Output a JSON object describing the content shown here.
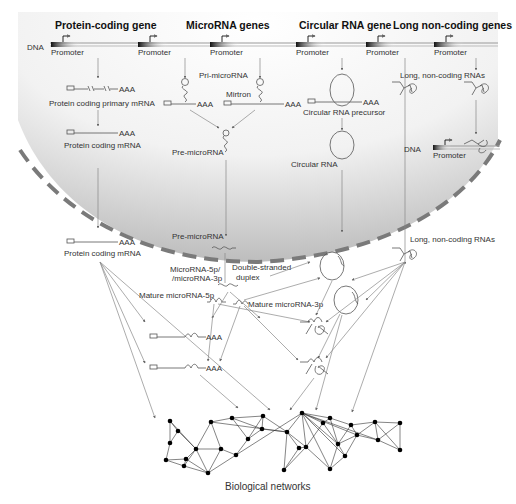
{
  "headers": {
    "protein_coding": "Protein-coding gene",
    "microrna": "MicroRNA genes",
    "circular": "Circular RNA gene",
    "lncrna": "Long non-coding genes"
  },
  "dna_label": "DNA",
  "promoter_label": "Promoter",
  "nucleus": {
    "protein_primary": "Protein coding primary mRNA",
    "protein_mrna": "Protein coding mRNA",
    "pri_microrna": "Pri-microRNA",
    "mirtron": "Mirtron",
    "pre_microrna": "Pre-microRNA",
    "circ_precursor": "Circular RNA precursor",
    "circ_rna": "Circular RNA",
    "lnc_rnas": "Long, non-coding RNAs",
    "dna_label2": "DNA",
    "promoter_label2": "Promoter",
    "polyA": "AAA"
  },
  "cytoplasm": {
    "protein_mrna": "Protein coding mRNA",
    "pre_microrna": "Pre-microRNA",
    "duplex_line1": "MicroRNA-5p/",
    "duplex_line2": "/microRNA-3p",
    "ds_line1": "Double-stranded",
    "ds_line2": "duplex",
    "mature_5p": "Mature microRNA-5p",
    "mature_3p": "Mature microRNA-3p",
    "lnc_rnas": "Long, non-coding RNAs",
    "polyA": "AAA"
  },
  "network": {
    "label": "Biological networks",
    "nodes": [
      [
        170,
        421
      ],
      [
        211,
        422
      ],
      [
        232,
        418
      ],
      [
        263,
        416
      ],
      [
        302,
        413
      ],
      [
        323,
        423
      ],
      [
        330,
        418
      ],
      [
        351,
        425
      ],
      [
        375,
        422
      ],
      [
        400,
        423
      ],
      [
        178,
        431
      ],
      [
        170,
        443
      ],
      [
        196,
        449
      ],
      [
        221,
        449
      ],
      [
        248,
        439
      ],
      [
        262,
        429
      ],
      [
        287,
        432
      ],
      [
        306,
        447
      ],
      [
        299,
        448
      ],
      [
        338,
        444
      ],
      [
        357,
        435
      ],
      [
        378,
        440
      ],
      [
        400,
        450
      ],
      [
        345,
        456
      ],
      [
        330,
        469
      ],
      [
        236,
        455
      ],
      [
        208,
        473
      ],
      [
        184,
        466
      ],
      [
        166,
        460
      ],
      [
        186,
        459
      ],
      [
        284,
        470
      ]
    ]
  }
}
